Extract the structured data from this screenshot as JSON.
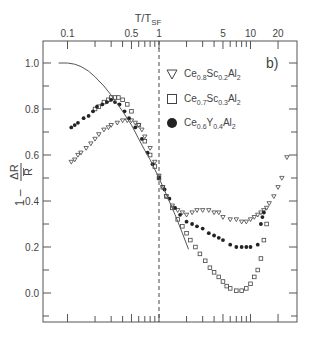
{
  "chart_data": {
    "type": "scatter",
    "title": "",
    "panel_label": "b)",
    "xlabel": "T/T_SF",
    "xlabel_main": "T/T",
    "xlabel_sub": "SF",
    "ylabel": "1 - ΔR/R̄",
    "xscale": "log",
    "xlim": [
      0.08,
      28
    ],
    "ylim": [
      -0.12,
      1.12
    ],
    "x_ticks": [
      {
        "value": 0.1,
        "label": "0.1"
      },
      {
        "value": 0.5,
        "label": "0.5"
      },
      {
        "value": 1,
        "label": "1"
      },
      {
        "value": 5,
        "label": "5"
      },
      {
        "value": 10,
        "label": "10"
      },
      {
        "value": 20,
        "label": "20"
      }
    ],
    "y_ticks": [
      {
        "value": 1.0,
        "label": "1.0"
      },
      {
        "value": 0.8,
        "label": "0.8"
      },
      {
        "value": 0.6,
        "label": "0.6"
      },
      {
        "value": 0.4,
        "label": "0.4"
      },
      {
        "value": 0.2,
        "label": "0.2"
      },
      {
        "value": 0.0,
        "label": "0.0"
      }
    ],
    "vline": {
      "x": 1,
      "style": "dashed"
    },
    "grid": false,
    "legend_position": "upper right",
    "series": [
      {
        "name": "Ce0.8Sc0.2Al2",
        "legend": {
          "base": "Ce",
          "parts": [
            [
              "0.8",
              "Sc"
            ],
            [
              "0.2",
              "Al"
            ],
            [
              "2",
              ""
            ]
          ]
        },
        "marker": "triangle-down-open",
        "x": [
          0.11,
          0.12,
          0.13,
          0.14,
          0.16,
          0.18,
          0.2,
          0.22,
          0.25,
          0.28,
          0.3,
          0.35,
          0.4,
          0.45,
          0.5,
          0.55,
          0.6,
          0.65,
          0.7,
          0.8,
          0.9,
          1.0,
          1.1,
          1.2,
          1.4,
          1.6,
          1.8,
          2.0,
          2.3,
          2.6,
          3.0,
          3.5,
          4.0,
          4.5,
          5.0,
          6.0,
          7.0,
          8.0,
          9.0,
          10.0,
          11.0,
          12.0,
          13.0,
          14.0,
          15.0,
          16.0,
          18.0,
          20.0,
          22.0,
          25.0
        ],
        "y": [
          0.57,
          0.58,
          0.6,
          0.61,
          0.63,
          0.65,
          0.67,
          0.69,
          0.71,
          0.72,
          0.73,
          0.74,
          0.75,
          0.75,
          0.75,
          0.74,
          0.73,
          0.71,
          0.68,
          0.63,
          0.57,
          0.51,
          0.46,
          0.42,
          0.38,
          0.36,
          0.35,
          0.34,
          0.35,
          0.36,
          0.36,
          0.36,
          0.35,
          0.35,
          0.33,
          0.32,
          0.32,
          0.31,
          0.31,
          0.32,
          0.33,
          0.34,
          0.35,
          0.36,
          0.37,
          0.39,
          0.42,
          0.46,
          0.5,
          0.59
        ]
      },
      {
        "name": "Ce0.7Sc0.3Al2",
        "legend": {
          "base": "Ce",
          "parts": [
            [
              "0.7",
              "Sc"
            ],
            [
              "0.3",
              "Al"
            ],
            [
              "2",
              ""
            ]
          ]
        },
        "marker": "square-open",
        "x": [
          0.2,
          0.22,
          0.25,
          0.28,
          0.3,
          0.33,
          0.36,
          0.4,
          0.45,
          0.5,
          0.6,
          0.7,
          0.8,
          0.9,
          1.0,
          1.1,
          1.2,
          1.4,
          1.6,
          1.8,
          2.0,
          2.2,
          2.5,
          2.8,
          3.2,
          3.6,
          4.0,
          4.5,
          5.0,
          5.5,
          6.0,
          7.0,
          8.0,
          9.0,
          10.0,
          11.0,
          12.0,
          13.0,
          14.0,
          15.0
        ],
        "y": [
          0.8,
          0.81,
          0.83,
          0.84,
          0.85,
          0.85,
          0.85,
          0.84,
          0.82,
          0.79,
          0.73,
          0.66,
          0.6,
          0.55,
          0.5,
          0.46,
          0.42,
          0.37,
          0.32,
          0.29,
          0.26,
          0.23,
          0.2,
          0.17,
          0.14,
          0.11,
          0.09,
          0.07,
          0.05,
          0.03,
          0.02,
          0.01,
          0.01,
          0.02,
          0.04,
          0.07,
          0.1,
          0.15,
          0.23,
          0.3
        ]
      },
      {
        "name": "Ce0.6Y0.4Al2",
        "legend": {
          "base": "Ce",
          "parts": [
            [
              "0.6",
              "Y"
            ],
            [
              "0.4",
              "Al"
            ],
            [
              "2",
              ""
            ]
          ]
        },
        "marker": "circle-filled",
        "x": [
          0.11,
          0.12,
          0.13,
          0.15,
          0.17,
          0.19,
          0.21,
          0.24,
          0.27,
          0.3,
          0.33,
          0.37,
          0.42,
          0.47,
          0.55,
          0.65,
          0.75,
          0.85,
          1.0,
          1.15,
          1.3,
          1.5,
          1.7,
          2.0,
          2.3,
          2.6,
          3.0,
          3.5,
          4.0,
          4.5,
          5.0,
          6.0,
          7.0,
          8.0,
          9.0,
          10.0,
          12.0,
          13.0,
          13.5,
          14.0
        ],
        "y": [
          0.72,
          0.73,
          0.74,
          0.76,
          0.77,
          0.79,
          0.81,
          0.82,
          0.83,
          0.84,
          0.83,
          0.82,
          0.79,
          0.76,
          0.72,
          0.67,
          0.61,
          0.56,
          0.5,
          0.45,
          0.41,
          0.37,
          0.34,
          0.31,
          0.3,
          0.29,
          0.28,
          0.26,
          0.25,
          0.24,
          0.23,
          0.21,
          0.2,
          0.2,
          0.2,
          0.2,
          0.21,
          0.3,
          0.33,
          0.35
        ]
      },
      {
        "name": "theory curve",
        "marker": "line",
        "x": [
          0.08,
          0.1,
          0.12,
          0.14,
          0.17,
          0.2,
          0.25,
          0.3,
          0.4,
          0.5,
          0.6,
          0.7,
          0.8,
          1.0,
          1.2,
          1.5,
          1.8,
          2.1
        ],
        "y": [
          1.0,
          1.0,
          0.995,
          0.985,
          0.965,
          0.94,
          0.9,
          0.86,
          0.79,
          0.73,
          0.67,
          0.62,
          0.58,
          0.5,
          0.43,
          0.34,
          0.26,
          0.19
        ]
      }
    ]
  }
}
